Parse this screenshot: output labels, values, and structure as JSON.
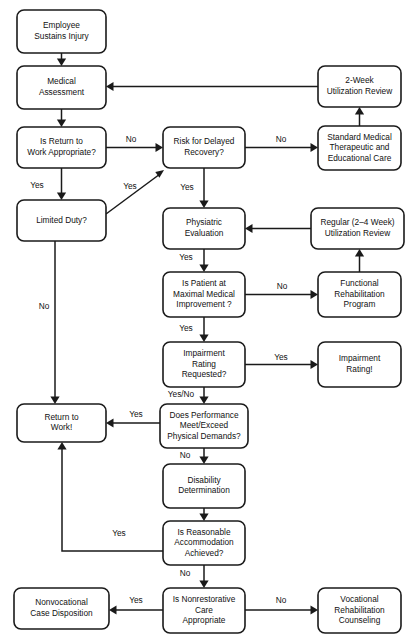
{
  "diagram": {
    "type": "flowchart",
    "canvas": {
      "width": 412,
      "height": 643
    },
    "colors": {
      "background": "#ffffff",
      "box_stroke": "#1a1a1a",
      "box_fill": "#ffffff",
      "text": "#111111",
      "arrow": "#1a1a1a"
    },
    "nodes": [
      {
        "id": "employee-sustains-injury",
        "lines": [
          "Employee",
          "Sustains  Injury"
        ],
        "x": 17,
        "y": 10,
        "w": 89,
        "h": 43
      },
      {
        "id": "medical-assessment",
        "lines": [
          "Medical",
          "Assessment"
        ],
        "x": 17,
        "y": 66,
        "w": 89,
        "h": 43
      },
      {
        "id": "is-return-to-work-appropriate",
        "lines": [
          "Is Return to",
          "Work Appropriate?"
        ],
        "x": 17,
        "y": 127,
        "w": 89,
        "h": 41
      },
      {
        "id": "limited-duty",
        "lines": [
          "Limited Duty?"
        ],
        "x": 17,
        "y": 200,
        "w": 89,
        "h": 41
      },
      {
        "id": "return-to-work",
        "lines": [
          "Return to",
          "Work!"
        ],
        "x": 17,
        "y": 404,
        "w": 89,
        "h": 38
      },
      {
        "id": "nonvocational-case-disposition",
        "lines": [
          "Nonvocational",
          "Case Disposition"
        ],
        "x": 14,
        "y": 588,
        "w": 95,
        "h": 41
      },
      {
        "id": "risk-for-delayed-recovery",
        "lines": [
          "Risk for Delayed",
          "Recovery?"
        ],
        "x": 163,
        "y": 127,
        "w": 82,
        "h": 41
      },
      {
        "id": "physiatric-evaluation",
        "lines": [
          "Physiatric",
          "Evaluation"
        ],
        "x": 163,
        "y": 208,
        "w": 82,
        "h": 41
      },
      {
        "id": "is-patient-at-mmi",
        "lines": [
          "Is Patient at",
          "Maximal Medical",
          "Improvement ?"
        ],
        "x": 163,
        "y": 272,
        "w": 82,
        "h": 45
      },
      {
        "id": "impairment-rating-requested",
        "lines": [
          "Impairment",
          "Rating",
          "Requested?"
        ],
        "x": 163,
        "y": 342,
        "w": 82,
        "h": 45
      },
      {
        "id": "does-performance-meet-exceed",
        "lines": [
          "Does Performance",
          "Meet/Exceed",
          "Physical Demands?"
        ],
        "x": 160,
        "y": 404,
        "w": 88,
        "h": 44
      },
      {
        "id": "disability-determination",
        "lines": [
          "Disability",
          "Determination"
        ],
        "x": 163,
        "y": 464,
        "w": 82,
        "h": 44
      },
      {
        "id": "is-reasonable-accommodation-achieved",
        "lines": [
          "Is Reasonable",
          "Accommodation",
          "Achieved?"
        ],
        "x": 163,
        "y": 521,
        "w": 82,
        "h": 44
      },
      {
        "id": "is-nonrestorative-care-appropriate",
        "lines": [
          "Is Nonrestorative",
          "Care",
          "Appropriate"
        ],
        "x": 163,
        "y": 588,
        "w": 82,
        "h": 45
      },
      {
        "id": "two-week-utilization-review",
        "lines": [
          "2-Week",
          "Utilization Review"
        ],
        "x": 318,
        "y": 66,
        "w": 83,
        "h": 41
      },
      {
        "id": "standard-medical-care",
        "lines": [
          "Standard Medical",
          "Therapeutic and",
          "Educational Care"
        ],
        "x": 318,
        "y": 126,
        "w": 83,
        "h": 44
      },
      {
        "id": "regular-utilization-review",
        "lines": [
          "Regular (2–4 Week)",
          "Utilization Review"
        ],
        "x": 311,
        "y": 208,
        "w": 93,
        "h": 41
      },
      {
        "id": "functional-rehabilitation-program",
        "lines": [
          "Functional",
          "Rehabilitation",
          "Program"
        ],
        "x": 318,
        "y": 272,
        "w": 83,
        "h": 45
      },
      {
        "id": "impairment-rating-result",
        "lines": [
          "Impairment",
          "Rating!"
        ],
        "x": 318,
        "y": 342,
        "w": 83,
        "h": 45
      },
      {
        "id": "vocational-rehabilitation-counseling",
        "lines": [
          "Vocational",
          "Rehabilitation",
          "Counseling"
        ],
        "x": 318,
        "y": 588,
        "w": 83,
        "h": 45
      }
    ],
    "edges": [
      {
        "id": "injury-to-assessment",
        "label": "",
        "path": "M 61.5 53 L 61.5 60",
        "arrow": "down",
        "tip_x": 61.5,
        "tip_y": 66
      },
      {
        "id": "assessment-to-return-question",
        "label": "",
        "path": "M 61.5 109 L 61.5 121",
        "arrow": "down",
        "tip_x": 61.5,
        "tip_y": 127
      },
      {
        "id": "return-question-no-to-risk",
        "label": "No",
        "label_x": 131,
        "label_y": 140,
        "path": "M 106 147.5 L 157 147.5",
        "arrow": "right",
        "tip_x": 163,
        "tip_y": 147.5
      },
      {
        "id": "return-question-yes-to-limited-duty",
        "label": "Yes",
        "label_x": 37,
        "label_y": 186,
        "path": "M 61.5 168 L 61.5 194",
        "arrow": "down",
        "tip_x": 61.5,
        "tip_y": 200
      },
      {
        "id": "limited-duty-yes-to-risk",
        "label": "Yes",
        "label_x": 130,
        "label_y": 187,
        "path": "M 106 214 L 160 174",
        "arrow": "up-right",
        "tip_x": 164,
        "tip_y": 170
      },
      {
        "id": "limited-duty-no-to-return-to-work",
        "label": "No",
        "label_x": 44,
        "label_y": 307,
        "path": "M 55 241 L 55 398",
        "arrow": "down",
        "tip_x": 55,
        "tip_y": 404
      },
      {
        "id": "risk-no-to-standard-care",
        "label": "No",
        "label_x": 281,
        "label_y": 140,
        "path": "M 245 147.5 L 312 147.5",
        "arrow": "right",
        "tip_x": 318,
        "tip_y": 147.5
      },
      {
        "id": "standard-care-to-two-week-review",
        "label": "",
        "path": "M 359.5 126 L 359.5 113",
        "arrow": "up",
        "tip_x": 359.5,
        "tip_y": 107
      },
      {
        "id": "two-week-review-to-assessment",
        "label": "",
        "path": "M 318 86.5 L 112 86.5",
        "arrow": "left",
        "tip_x": 106,
        "tip_y": 86.5
      },
      {
        "id": "risk-yes-to-physiatric",
        "label": "Yes",
        "label_x": 187,
        "label_y": 188,
        "path": "M 204 168 L 204 202",
        "arrow": "down",
        "tip_x": 204,
        "tip_y": 208
      },
      {
        "id": "regular-review-to-physiatric",
        "label": "",
        "path": "M 311 228.5 L 251 228.5",
        "arrow": "left",
        "tip_x": 245,
        "tip_y": 228.5
      },
      {
        "id": "physiatric-yes-to-mmi",
        "label": "Yes",
        "label_x": 186,
        "label_y": 258,
        "path": "M 204 249 L 204 266",
        "arrow": "down",
        "tip_x": 204,
        "tip_y": 272
      },
      {
        "id": "mmi-no-to-functional-rehab",
        "label": "No",
        "label_x": 282,
        "label_y": 287,
        "path": "M 245 294.5 L 312 294.5",
        "arrow": "right",
        "tip_x": 318,
        "tip_y": 294.5
      },
      {
        "id": "functional-rehab-to-regular-review",
        "label": "",
        "path": "M 359.5 272 L 359.5 255",
        "arrow": "up",
        "tip_x": 359.5,
        "tip_y": 249
      },
      {
        "id": "mmi-yes-to-impairment-question",
        "label": "Yes",
        "label_x": 186,
        "label_y": 329,
        "path": "M 204 317 L 204 336",
        "arrow": "down",
        "tip_x": 204,
        "tip_y": 342
      },
      {
        "id": "impairment-yes-to-rating",
        "label": "Yes",
        "label_x": 281,
        "label_y": 358,
        "path": "M 245 364.5 L 312 364.5",
        "arrow": "right",
        "tip_x": 318,
        "tip_y": 364.5
      },
      {
        "id": "impairment-yesno-to-performance",
        "label": "Yes/No",
        "label_x": 181,
        "label_y": 395,
        "path": "M 204 387 L 204 398",
        "arrow": "down",
        "tip_x": 204,
        "tip_y": 404
      },
      {
        "id": "performance-yes-to-return-to-work",
        "label": "Yes",
        "label_x": 136,
        "label_y": 415,
        "path": "M 160 423 L 112 423",
        "arrow": "left",
        "tip_x": 106,
        "tip_y": 423
      },
      {
        "id": "performance-no-to-disability",
        "label": "No",
        "label_x": 185,
        "label_y": 456,
        "path": "M 204 448 L 204 458",
        "arrow": "down",
        "tip_x": 204,
        "tip_y": 464
      },
      {
        "id": "disability-to-accommodation",
        "label": "",
        "path": "M 204 508 L 204 515",
        "arrow": "down",
        "tip_x": 204,
        "tip_y": 521
      },
      {
        "id": "accommodation-yes-to-return-to-work",
        "label": "Yes",
        "label_x": 119,
        "label_y": 534,
        "path": "M 163 551 L 62 551 L 62 448",
        "arrow": "up",
        "tip_x": 62,
        "tip_y": 442
      },
      {
        "id": "accommodation-no-to-nonrestorative",
        "label": "No",
        "label_x": 185,
        "label_y": 574,
        "path": "M 204 565 L 204 582",
        "arrow": "down",
        "tip_x": 204,
        "tip_y": 588
      },
      {
        "id": "nonrestorative-yes-to-nonvocational",
        "label": "Yes",
        "label_x": 136,
        "label_y": 601,
        "path": "M 163 610 L 115 610",
        "arrow": "left",
        "tip_x": 109,
        "tip_y": 610
      },
      {
        "id": "nonrestorative-no-to-vocational",
        "label": "No",
        "label_x": 281,
        "label_y": 601,
        "path": "M 245 610 L 312 610",
        "arrow": "right",
        "tip_x": 318,
        "tip_y": 610
      }
    ]
  }
}
